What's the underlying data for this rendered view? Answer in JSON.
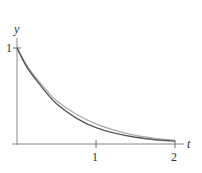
{
  "chart_data": {
    "type": "line",
    "title": "",
    "xlabel": "t",
    "ylabel": "y",
    "xlim": [
      0,
      2.1
    ],
    "ylim": [
      0,
      1.1
    ],
    "grid": false,
    "legend": null,
    "x_ticks": [
      {
        "value": 1,
        "label": "1"
      },
      {
        "value": 2,
        "label": "2"
      }
    ],
    "y_ticks": [
      {
        "value": 1,
        "label": "1"
      }
    ],
    "x": [
      0,
      0.125,
      0.25,
      0.375,
      0.5,
      0.75,
      1.0,
      1.25,
      1.5,
      1.75,
      2.0
    ],
    "series": [
      {
        "name": "dark curve",
        "color": "#555555",
        "values": [
          1.0,
          0.8,
          0.66,
          0.53,
          0.42,
          0.27,
          0.17,
          0.11,
          0.07,
          0.045,
          0.03
        ]
      },
      {
        "name": "light curve",
        "color": "#aaaaaa",
        "values": [
          1.0,
          0.82,
          0.68,
          0.56,
          0.45,
          0.31,
          0.21,
          0.14,
          0.09,
          0.06,
          0.04
        ]
      }
    ]
  },
  "labels": {
    "y_axis": "y",
    "x_axis": "t",
    "y_tick_1": "1",
    "x_tick_1": "1",
    "x_tick_2": "2"
  },
  "layout": {
    "origin_x": 17,
    "origin_y": 144,
    "px_per_x": 79,
    "px_per_y": 96
  }
}
